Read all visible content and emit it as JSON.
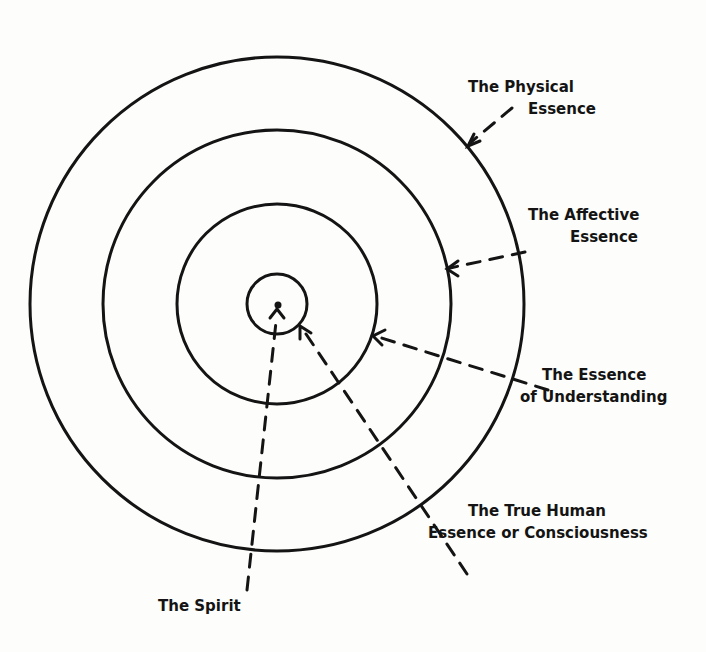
{
  "diagram": {
    "type": "concentric-circles",
    "center": [
      277,
      304
    ],
    "rings": [
      {
        "name": "spirit-core",
        "radius": 30
      },
      {
        "name": "understanding-ring",
        "radius": 100
      },
      {
        "name": "affective-ring",
        "radius": 174
      },
      {
        "name": "physical-ring",
        "radius": 247
      }
    ],
    "labels": {
      "physical": {
        "line1": "The Physical",
        "line2": "Essence"
      },
      "affective": {
        "line1": "The Affective",
        "line2": "Essence"
      },
      "understanding": {
        "line1": "The Essence",
        "line2": "of Understanding"
      },
      "true_human": {
        "line1": "The True Human",
        "line2": "Essence or Consciousness"
      },
      "spirit": {
        "line1": "The Spirit"
      }
    },
    "ink_color": "#141414",
    "paper_color": "#fdfdfb"
  }
}
